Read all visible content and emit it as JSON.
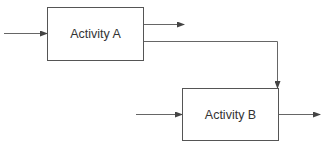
{
  "diagram": {
    "activities": [
      {
        "id": "A",
        "label": "Activity A"
      },
      {
        "id": "B",
        "label": "Activity B"
      }
    ],
    "connections": [
      {
        "from": "external",
        "to": "A",
        "label": ""
      },
      {
        "from": "A",
        "to": "external",
        "label": ""
      },
      {
        "from": "A",
        "to": "B",
        "label": ""
      },
      {
        "from": "external",
        "to": "B",
        "label": ""
      },
      {
        "from": "B",
        "to": "external",
        "label": ""
      }
    ],
    "colors": {
      "line": "#555555",
      "text": "#333333",
      "background": "#ffffff"
    }
  }
}
